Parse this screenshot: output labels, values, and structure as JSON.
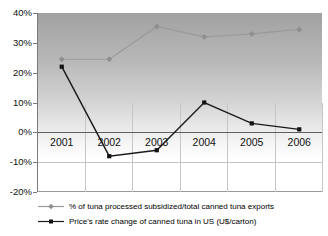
{
  "chart_data": {
    "type": "line",
    "title": "",
    "xlabel": "",
    "ylabel": "",
    "categories": [
      "2001",
      "2002",
      "2003",
      "2004",
      "2005",
      "2006"
    ],
    "series": [
      {
        "name": "% of tuna processed subsidized/total canned tuna exports",
        "values": [
          24.5,
          24.5,
          35.5,
          32,
          33,
          34.5
        ],
        "color": "#9a9a9a",
        "marker": "diamond",
        "marker_color": "#8f8f8f"
      },
      {
        "name": "Price's rate change of canned tuna in US (U$/carton)",
        "values": [
          22,
          -8,
          -6,
          10,
          3,
          1
        ],
        "color": "#1a1a1a",
        "marker": "square",
        "marker_color": "#111111"
      }
    ],
    "ylim": [
      -20,
      40
    ],
    "y_tick_step": 10,
    "y_tick_labels": [
      "40%",
      "30%",
      "20%",
      "10%",
      "0%",
      "-10%",
      "-20%"
    ],
    "y_tick_values": [
      40,
      30,
      20,
      10,
      0,
      -10,
      -20
    ],
    "h_gridlines_visible": [
      -10
    ],
    "vgrid_start_value": 10,
    "grid_vertical": true,
    "legend_position": "bottom-left",
    "plot_bg_top_color": "#a1a1a1",
    "plot_bg_bottom_color": "#ffffff",
    "axis_color": "#7a7a7a",
    "zero_line_color": "#5f5f5f",
    "gridline_color": "#c6c6c6"
  }
}
